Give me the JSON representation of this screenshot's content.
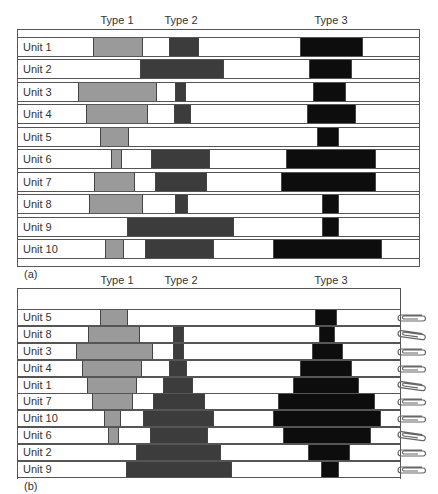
{
  "panel_a": {
    "tag": "(a)",
    "column_labels": [
      "Type 1",
      "Type 2",
      "Type 3"
    ],
    "rows": [
      {
        "label": "Unit 1",
        "type1": [
          93,
          143
        ],
        "type2": [
          169,
          199
        ],
        "type3": [
          300,
          363
        ]
      },
      {
        "label": "Unit 2",
        "type1": null,
        "type2": [
          140,
          224
        ],
        "type3": [
          309,
          352
        ]
      },
      {
        "label": "Unit 3",
        "type1": [
          78,
          157
        ],
        "type2": [
          175,
          186
        ],
        "type3": [
          313,
          346
        ]
      },
      {
        "label": "Unit 4",
        "type1": [
          86,
          148
        ],
        "type2": [
          174,
          191
        ],
        "type3": [
          307,
          356
        ]
      },
      {
        "label": "Unit 5",
        "type1": [
          100,
          129
        ],
        "type2": null,
        "type3": [
          317,
          339
        ]
      },
      {
        "label": "Unit 6",
        "type1": [
          111,
          122
        ],
        "type2": [
          151,
          210
        ],
        "type3": [
          286,
          376
        ]
      },
      {
        "label": "Unit 7",
        "type1": [
          94,
          135
        ],
        "type2": [
          155,
          207
        ],
        "type3": [
          281,
          376
        ]
      },
      {
        "label": "Unit 8",
        "type1": [
          89,
          143
        ],
        "type2": [
          175,
          188
        ],
        "type3": [
          322,
          339
        ]
      },
      {
        "label": "Unit 9",
        "type1": null,
        "type2": [
          127,
          234
        ],
        "type3": [
          322,
          339
        ]
      },
      {
        "label": "Unit 10",
        "type1": [
          105,
          124
        ],
        "type2": [
          145,
          214
        ],
        "type3": [
          273,
          382
        ]
      }
    ]
  },
  "panel_b": {
    "tag": "(b)",
    "column_labels": [
      "Type 1",
      "Type 2",
      "Type 3"
    ],
    "rows": [
      {
        "label": "Unit 5",
        "type1": [
          100,
          128
        ],
        "type2": null,
        "type3": [
          315,
          337
        ]
      },
      {
        "label": "Unit 8",
        "type1": [
          88,
          140
        ],
        "type2": [
          173,
          184
        ],
        "type3": [
          319,
          335
        ]
      },
      {
        "label": "Unit 3",
        "type1": [
          76,
          153
        ],
        "type2": [
          173,
          184
        ],
        "type3": [
          312,
          343
        ]
      },
      {
        "label": "Unit 4",
        "type1": [
          82,
          142
        ],
        "type2": [
          169,
          187
        ],
        "type3": [
          300,
          352
        ]
      },
      {
        "label": "Unit 1",
        "type1": [
          87,
          137
        ],
        "type2": [
          163,
          193
        ],
        "type3": [
          293,
          359
        ]
      },
      {
        "label": "Unit 7",
        "type1": [
          92,
          133
        ],
        "type2": [
          153,
          205
        ],
        "type3": [
          278,
          375
        ]
      },
      {
        "label": "Unit 10",
        "type1": [
          104,
          121
        ],
        "type2": [
          143,
          214
        ],
        "type3": [
          273,
          381
        ]
      },
      {
        "label": "Unit 6",
        "type1": [
          108,
          119
        ],
        "type2": [
          150,
          208
        ],
        "type3": [
          283,
          371
        ]
      },
      {
        "label": "Unit 2",
        "type1": null,
        "type2": [
          136,
          221
        ],
        "type3": [
          308,
          350
        ]
      },
      {
        "label": "Unit 9",
        "type1": null,
        "type2": [
          126,
          232
        ],
        "type3": [
          321,
          339
        ]
      }
    ],
    "clip_icon": "paper-clip-icon"
  },
  "colors": {
    "type1": "#9a9a9a",
    "type2": "#3c3c3c",
    "type3": "#0d0d0d",
    "frame": "#555555"
  }
}
